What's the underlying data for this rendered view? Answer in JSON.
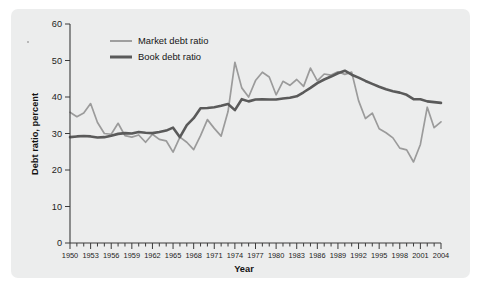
{
  "figure": {
    "background_color": "#ffffff",
    "panel_color": "#eceded"
  },
  "axes": {
    "y_title": "Debt ratio, percent",
    "x_title": "Year",
    "y_ticks": [
      0,
      10,
      20,
      30,
      40,
      50,
      60
    ],
    "x_tick_labels": [
      "1950",
      "1953",
      "1956",
      "1959",
      "1962",
      "1965",
      "1968",
      "1971",
      "1974",
      "1977",
      "1980",
      "1983",
      "1986",
      "1989",
      "1992",
      "1995",
      "1998",
      "2001",
      "2004"
    ]
  },
  "legend": {
    "position": "top-left-inside",
    "entries": [
      {
        "label": "Market debt ratio",
        "color": "#9b9b9b"
      },
      {
        "label": "Book debt ratio",
        "color": "#5a5a5a"
      }
    ]
  },
  "chart_data": {
    "type": "line",
    "title": "",
    "xlabel": "Year",
    "ylabel": "Debt ratio, percent",
    "xlim": [
      1950,
      2004
    ],
    "ylim": [
      0,
      60
    ],
    "grid": false,
    "legend_position": "upper left",
    "x": [
      1950,
      1951,
      1952,
      1953,
      1954,
      1955,
      1956,
      1957,
      1958,
      1959,
      1960,
      1961,
      1962,
      1963,
      1964,
      1965,
      1966,
      1967,
      1968,
      1969,
      1970,
      1971,
      1972,
      1973,
      1974,
      1975,
      1976,
      1977,
      1978,
      1979,
      1980,
      1981,
      1982,
      1983,
      1984,
      1985,
      1986,
      1987,
      1988,
      1989,
      1990,
      1991,
      1992,
      1993,
      1994,
      1995,
      1996,
      1997,
      1998,
      1999,
      2000,
      2001,
      2002,
      2003,
      2004
    ],
    "series": [
      {
        "name": "Market debt ratio",
        "color": "#9b9b9b",
        "values": [
          35.8,
          34.6,
          35.6,
          38.2,
          33.0,
          30.0,
          29.8,
          32.8,
          29.4,
          29.0,
          29.6,
          27.6,
          29.8,
          28.4,
          28.0,
          24.9,
          29.0,
          27.6,
          25.6,
          29.4,
          33.8,
          31.4,
          29.3,
          36.0,
          49.5,
          42.5,
          40.0,
          44.5,
          46.8,
          45.5,
          40.6,
          44.3,
          43.2,
          44.8,
          42.9,
          47.9,
          44.4,
          46.3,
          46.0,
          46.9,
          46.2,
          46.8,
          39.0,
          34.1,
          35.6,
          31.3,
          30.2,
          28.8,
          26.0,
          25.5,
          22.2,
          27.0,
          37.2,
          31.6,
          33.2
        ]
      },
      {
        "name": "Book debt ratio",
        "color": "#5a5a5a",
        "values": [
          29.0,
          29.2,
          29.3,
          29.2,
          28.9,
          29.0,
          29.4,
          29.9,
          30.1,
          30.0,
          30.4,
          30.2,
          30.1,
          30.4,
          30.8,
          31.6,
          29.0,
          32.3,
          34.2,
          36.9,
          37.0,
          37.2,
          37.6,
          38.1,
          36.4,
          39.4,
          38.8,
          39.3,
          39.4,
          39.3,
          39.3,
          39.6,
          39.8,
          40.2,
          41.3,
          42.5,
          43.8,
          44.8,
          45.6,
          46.5,
          47.2,
          46.1,
          45.3,
          44.4,
          43.6,
          42.8,
          42.1,
          41.6,
          41.2,
          40.6,
          39.4,
          39.4,
          38.8,
          38.6,
          38.4
        ]
      }
    ]
  }
}
